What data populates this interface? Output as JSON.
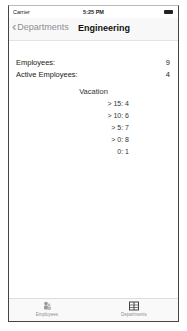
{
  "status_bar": {
    "carrier": "Carrier",
    "time": "5:25 PM"
  },
  "nav": {
    "back_label": "Departments",
    "title": "Engineering"
  },
  "stats": [
    {
      "label": "Employees:",
      "value": "9"
    },
    {
      "label": "Active Employees:",
      "value": "4"
    }
  ],
  "vacation": {
    "title": "Vacation",
    "lines": [
      "> 15:  4",
      "> 10:  6",
      "> 5:  7",
      "> 0:  8",
      "0:  1"
    ]
  },
  "tabbar": {
    "items": [
      {
        "label": "Employees",
        "icon": "people-icon",
        "selected": false
      },
      {
        "label": "Departments",
        "icon": "book-icon",
        "selected": true
      }
    ]
  }
}
